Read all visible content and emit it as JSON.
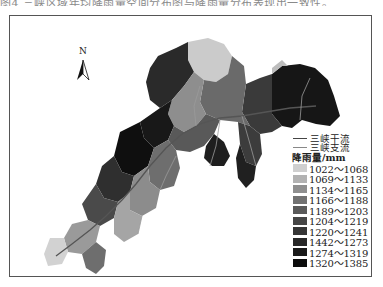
{
  "caption_partial": "图4 三峡区域年均降雨量空间分布图与降雨量分布表现出一致性。",
  "map": {
    "north_label": "N",
    "legend": {
      "lines": [
        {
          "label": "三峡干流",
          "icon": "mainstream-line-icon"
        },
        {
          "label": "三峡支流",
          "icon": "tributary-line-icon"
        }
      ],
      "title": "降雨量/mm",
      "classes": [
        {
          "label": "1022～1068",
          "color": "#cfcfcf"
        },
        {
          "label": "1069～1133",
          "color": "#b2b2b2"
        },
        {
          "label": "1134～1165",
          "color": "#8f8f8f"
        },
        {
          "label": "1166～1188",
          "color": "#727272"
        },
        {
          "label": "1189～1203",
          "color": "#5a5a5a"
        },
        {
          "label": "1204～1219",
          "color": "#464646"
        },
        {
          "label": "1220～1241",
          "color": "#363636"
        },
        {
          "label": "1442～1273",
          "color": "#282828"
        },
        {
          "label": "1274～1319",
          "color": "#1a1a1a"
        },
        {
          "label": "1320～1385",
          "color": "#0c0c0c"
        }
      ]
    }
  }
}
